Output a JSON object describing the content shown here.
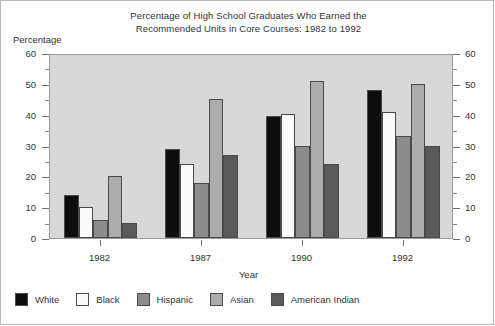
{
  "chart_data": {
    "type": "bar",
    "title": "Percentage of High School Graduates Who Earned the Recommended Units in Core Courses: 1982 to 1992",
    "title_line1": "Percentage of High School Graduates Who Earned the",
    "title_line2": "Recommended Units in Core Courses: 1982 to 1992",
    "xlabel": "Year",
    "ylabel": "Percentage",
    "categories": [
      "1982",
      "1987",
      "1990",
      "1992"
    ],
    "series": [
      {
        "name": "White",
        "color": "#0d0d0d",
        "values": [
          14,
          29,
          39.5,
          48
        ]
      },
      {
        "name": "Black",
        "color": "#fbfbfb",
        "values": [
          10,
          24,
          40.3,
          41
        ]
      },
      {
        "name": "Hispanic",
        "color": "#8c8c8c",
        "values": [
          6,
          18,
          30,
          33
        ]
      },
      {
        "name": "Asian",
        "color": "#acacac",
        "values": [
          20,
          45,
          51,
          50
        ]
      },
      {
        "name": "American Indian",
        "color": "#5a5a5a",
        "values": [
          5,
          27,
          24,
          30
        ]
      }
    ],
    "ylim": [
      0,
      60
    ],
    "ytick_major": [
      0,
      10,
      20,
      30,
      40,
      50,
      60
    ],
    "ytick_minor": [
      5,
      15,
      25,
      35,
      45,
      55
    ],
    "ytick_labels_left": [
      "0",
      "10",
      "20",
      "30",
      "40",
      "50",
      "60"
    ],
    "ytick_labels_right": [
      "0",
      "10",
      "20",
      "30",
      "40",
      "50",
      "60"
    ],
    "grid": false,
    "legend_position": "bottom-left",
    "plot_background": "#d8d8d8"
  }
}
